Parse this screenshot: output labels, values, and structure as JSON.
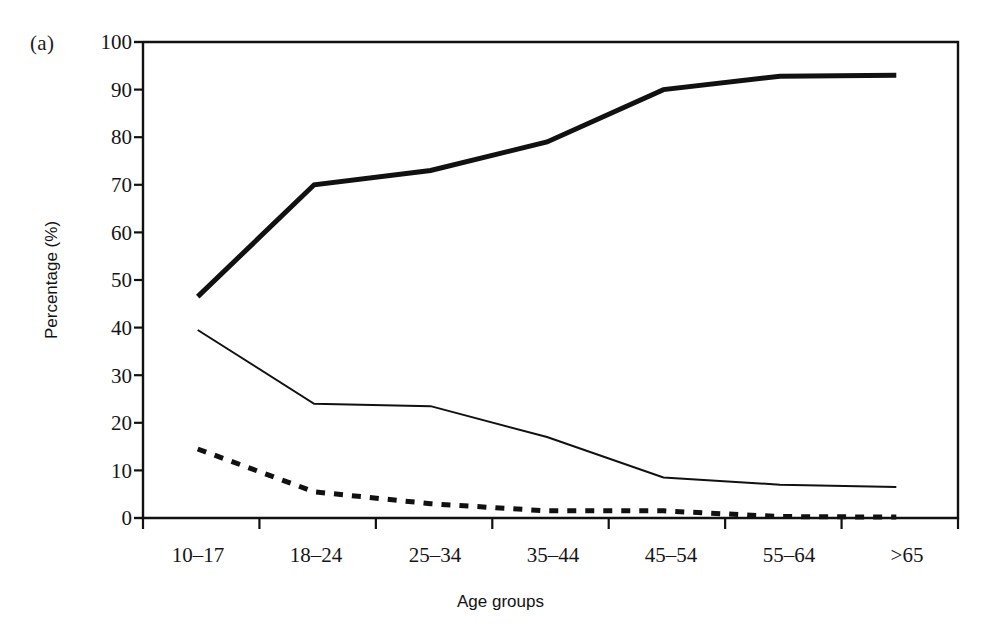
{
  "figure": {
    "panel_label": "(a)",
    "background_color": "#ffffff",
    "ink_color": "#111111"
  },
  "chart_data": {
    "type": "line",
    "title": "",
    "subtitle": "",
    "xlabel": "Age groups",
    "ylabel": "Percentage (%)",
    "categories": [
      "10–17",
      "18–24",
      "25–34",
      "35–44",
      "45–54",
      "55–64",
      ">65"
    ],
    "ylim": [
      0,
      100
    ],
    "yticks": [
      0,
      10,
      20,
      30,
      40,
      50,
      60,
      70,
      80,
      90,
      100
    ],
    "ytick_labels": [
      "0",
      "10",
      "20",
      "30",
      "40",
      "50",
      "60",
      "70",
      "80",
      "90",
      "100"
    ],
    "grid": false,
    "legend": "none",
    "legend_position": "none",
    "annotations": [],
    "series": [
      {
        "name": "thick-line-series",
        "style": "solid",
        "line_width": 5,
        "color": "#111111",
        "values": [
          46.5,
          70,
          73,
          79,
          90,
          92.8,
          93
        ]
      },
      {
        "name": "thin-line-series",
        "style": "solid",
        "line_width": 2,
        "color": "#111111",
        "values": [
          39.5,
          24,
          23.5,
          17,
          8.5,
          7,
          6.5
        ]
      },
      {
        "name": "dashed-line-series",
        "style": "dashed",
        "line_width": 5,
        "color": "#111111",
        "values": [
          14.5,
          5.5,
          3,
          1.5,
          1.5,
          0.3,
          0.2
        ]
      }
    ]
  },
  "axes": {
    "y_tick_labels": [
      "100",
      "90",
      "80",
      "70",
      "60",
      "50",
      "40",
      "30",
      "20",
      "10",
      "0"
    ],
    "x_tick_labels": [
      "10–17",
      "18–24",
      "25–34",
      "35–44",
      "45–54",
      "55–64",
      ">65"
    ],
    "y_axis_title": "Percentage (%)",
    "x_axis_title": "Age groups"
  }
}
